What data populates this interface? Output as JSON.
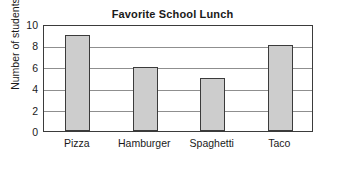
{
  "chart_data": {
    "type": "bar",
    "title": "Favorite School Lunch",
    "xlabel": "",
    "ylabel": "Number of students",
    "categories": [
      "Pizza",
      "Hamburger",
      "Spaghetti",
      "Taco"
    ],
    "values": [
      9,
      6,
      5,
      8
    ],
    "ylim": [
      0,
      10
    ],
    "ytick_labels": [
      "0",
      "2",
      "4",
      "6",
      "8",
      "10"
    ],
    "ytick_values": [
      0,
      2,
      4,
      6,
      8,
      10
    ],
    "grid": "horizontal",
    "legend": "none",
    "bar_fill_color": "#cdcdcd",
    "bar_edge_color": "#3b3b3b",
    "plot_background_color": "#ffffff",
    "axis_color": "#3b3b3b",
    "gridline_color": "#8f8f8f",
    "text_color": "#1a1a1a"
  }
}
